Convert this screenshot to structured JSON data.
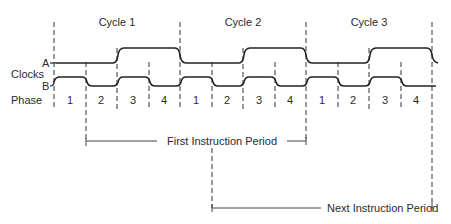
{
  "diagram": {
    "labels": {
      "clocks": "Clocks",
      "clock_a": "A",
      "clock_b": "B",
      "phase": "Phase"
    },
    "cycles": [
      {
        "label": "Cycle 1"
      },
      {
        "label": "Cycle 2"
      },
      {
        "label": "Cycle 3"
      }
    ],
    "phases": [
      "1",
      "2",
      "3",
      "4",
      "1",
      "2",
      "3",
      "4",
      "1",
      "2",
      "3",
      "4"
    ],
    "clock_a_pattern": "high during phases 3 and 4 of each cycle",
    "clock_b_pattern": "high during phases 1 and 3 of each cycle",
    "brackets": {
      "first_instruction": "First Instruction Period",
      "next_instruction": "Next Instruction Period"
    },
    "colors": {
      "line": "#222222",
      "text": "#2a2a2a",
      "background": "#ffffff"
    }
  }
}
